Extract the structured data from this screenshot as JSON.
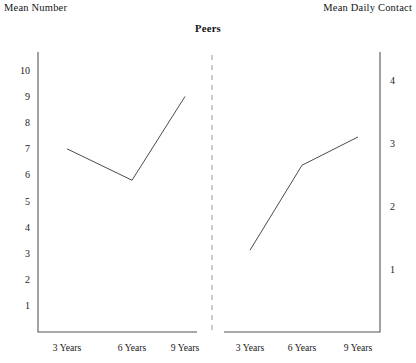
{
  "chart_data": {
    "type": "line",
    "title": "Peers",
    "panels": [
      {
        "name": "left-panel",
        "ylabel": "Mean Number",
        "categories": [
          "3 Years",
          "6 Years",
          "9 Years"
        ],
        "values": [
          7.0,
          5.8,
          9.0
        ],
        "yticks": [
          1,
          2,
          3,
          4,
          5,
          6,
          7,
          8,
          9,
          10
        ],
        "ylim": [
          0,
          10.7
        ],
        "axis_side": "left"
      },
      {
        "name": "right-panel",
        "ylabel": "Mean Daily Contact",
        "categories": [
          "3 Years",
          "6 Years",
          "9 Years"
        ],
        "values": [
          1.3,
          2.65,
          3.1
        ],
        "yticks": [
          1,
          2,
          3,
          4
        ],
        "ylim": [
          0,
          4.45
        ],
        "axis_side": "right"
      }
    ],
    "xlabel": "",
    "grid": false,
    "legend": null,
    "divider": "dashed vertical separator between panels"
  },
  "labels": {
    "left_axis_title": "Mean Number",
    "right_axis_title": "Mean Daily Contact",
    "chart_title": "Peers"
  }
}
